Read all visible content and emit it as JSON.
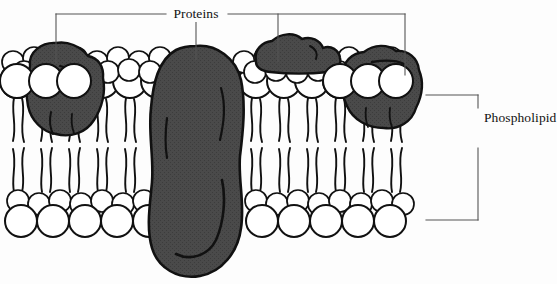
{
  "diagram": {
    "title_label": "Proteins",
    "bilayer_label": "Phospholipid bilayer",
    "colors": {
      "background": "#fdfdfd",
      "outline": "#111111",
      "protein_fill": "#484848",
      "head_fill": "#ffffff",
      "leader_line": "#555555"
    },
    "labels": [
      {
        "name": "proteins",
        "text": "Proteins"
      },
      {
        "name": "phospholipid-bilayer",
        "text": "Phospholipid bilayer"
      }
    ],
    "proteins": [
      {
        "name": "left-integral-protein",
        "type": "integral"
      },
      {
        "name": "central-transmembrane-protein",
        "type": "transmembrane"
      },
      {
        "name": "top-peripheral-protein",
        "type": "peripheral"
      },
      {
        "name": "right-integral-protein",
        "type": "integral"
      }
    ],
    "leaflets": [
      {
        "name": "outer-leaflet",
        "position": "top"
      },
      {
        "name": "inner-leaflet",
        "position": "bottom"
      }
    ],
    "brackets": [
      {
        "name": "proteins-bracket",
        "orientation": "horizontal-top",
        "leaders": 4
      },
      {
        "name": "bilayer-bracket",
        "orientation": "vertical-right",
        "leaders": 0
      }
    ]
  }
}
